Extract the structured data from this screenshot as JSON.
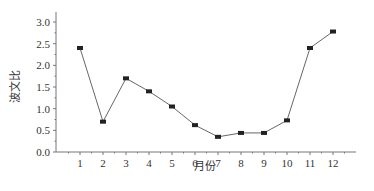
{
  "chart_data": {
    "type": "line",
    "title": "",
    "xlabel": "月份",
    "ylabel": "波文比",
    "x": [
      1,
      2,
      3,
      4,
      5,
      6,
      7,
      8,
      9,
      10,
      11,
      12
    ],
    "categories": [
      "1",
      "2",
      "3",
      "4",
      "5",
      "6",
      "7",
      "8",
      "9",
      "10",
      "11",
      "12"
    ],
    "series": [
      {
        "name": "波文比",
        "values": [
          2.4,
          0.7,
          1.7,
          1.4,
          1.05,
          0.62,
          0.35,
          0.44,
          0.44,
          0.73,
          2.4,
          2.78
        ]
      }
    ],
    "ylim": [
      0,
      3.0
    ],
    "yticks": [
      "0.0",
      "0.5",
      "1.0",
      "1.5",
      "2.0",
      "2.5",
      "3.0"
    ],
    "xlim": [
      0,
      13
    ],
    "grid": false,
    "legend": null,
    "marker": "square",
    "colors": {
      "line": "#555555",
      "marker": "#222222",
      "axis": "#777777"
    }
  }
}
